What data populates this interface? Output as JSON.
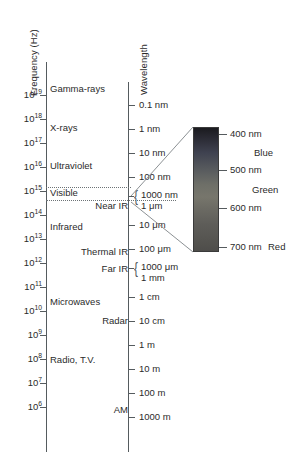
{
  "figure": {
    "background_color": "#ffffff",
    "line_color": "#555b5e",
    "text_color": "#2b2b2b"
  },
  "frequency_axis": {
    "title": "Frequency (Hz)",
    "unit": "Hz",
    "ticks": [
      {
        "mantissa": "10",
        "exponent": "19",
        "y": 95
      },
      {
        "mantissa": "10",
        "exponent": "18",
        "y": 119
      },
      {
        "mantissa": "10",
        "exponent": "17",
        "y": 143
      },
      {
        "mantissa": "10",
        "exponent": "16",
        "y": 167
      },
      {
        "mantissa": "10",
        "exponent": "15",
        "y": 191
      },
      {
        "mantissa": "10",
        "exponent": "14",
        "y": 215
      },
      {
        "mantissa": "10",
        "exponent": "13",
        "y": 239
      },
      {
        "mantissa": "10",
        "exponent": "12",
        "y": 263
      },
      {
        "mantissa": "10",
        "exponent": "11",
        "y": 287
      },
      {
        "mantissa": "10",
        "exponent": "10",
        "y": 311
      },
      {
        "mantissa": "10",
        "exponent": "9",
        "y": 335
      },
      {
        "mantissa": "10",
        "exponent": "8",
        "y": 359
      },
      {
        "mantissa": "10",
        "exponent": "7",
        "y": 383
      },
      {
        "mantissa": "10",
        "exponent": "6",
        "y": 407
      }
    ]
  },
  "wavelength_axis": {
    "title": "Wavelength",
    "ticks": [
      {
        "label": "0.1 nm",
        "y": 105
      },
      {
        "label": "1 nm",
        "y": 129
      },
      {
        "label": "10 nm",
        "y": 153
      },
      {
        "label": "100 nm",
        "y": 177
      },
      {
        "label": "10 μm",
        "y": 225
      },
      {
        "label": "100 μm",
        "y": 249
      },
      {
        "label": "1 cm",
        "y": 297
      },
      {
        "label": "10 cm",
        "y": 321
      },
      {
        "label": "1 m",
        "y": 345
      },
      {
        "label": "10 m",
        "y": 369
      },
      {
        "label": "100 m",
        "y": 393
      },
      {
        "label": "1000 m",
        "y": 417
      }
    ],
    "brace_groups": [
      {
        "lines": [
          "1000 nm",
          "1 μm"
        ],
        "y": 196
      },
      {
        "lines": [
          "1000 μm",
          "1 mm"
        ],
        "y": 268
      }
    ]
  },
  "bands": [
    {
      "name": "Gamma-rays",
      "y": 88,
      "align": "left"
    },
    {
      "name": "X-rays",
      "y": 127,
      "align": "left"
    },
    {
      "name": "Ultraviolet",
      "y": 165,
      "align": "left"
    },
    {
      "name": "Visible",
      "y": 192,
      "align": "left"
    },
    {
      "name": "Near IR",
      "y": 205,
      "align": "right"
    },
    {
      "name": "Infrared",
      "y": 226,
      "align": "left"
    },
    {
      "name": "Thermal IR",
      "y": 251,
      "align": "right"
    },
    {
      "name": "Far IR",
      "y": 268,
      "align": "right"
    },
    {
      "name": "Microwaves",
      "y": 301,
      "align": "left"
    },
    {
      "name": "Radar",
      "y": 320,
      "align": "right"
    },
    {
      "name": "Radio, T.V.",
      "y": 359,
      "align": "left"
    },
    {
      "name": "AM",
      "y": 409,
      "align": "right"
    }
  ],
  "visible_detail": {
    "bar": {
      "description": "visible-spectrum-gradient-bar",
      "top_wavelength_nm": 380,
      "bottom_wavelength_nm": 720
    },
    "ticks": [
      {
        "label": "400 nm",
        "y": 134
      },
      {
        "label": "500 nm",
        "y": 170
      },
      {
        "label": "600 nm",
        "y": 208
      },
      {
        "label": "700 nm",
        "y": 247
      }
    ],
    "color_names": [
      {
        "label": "Blue",
        "x": 254,
        "y": 152
      },
      {
        "label": "Green",
        "x": 252,
        "y": 189
      },
      {
        "label": "Red",
        "x": 268,
        "y": 247
      }
    ]
  }
}
